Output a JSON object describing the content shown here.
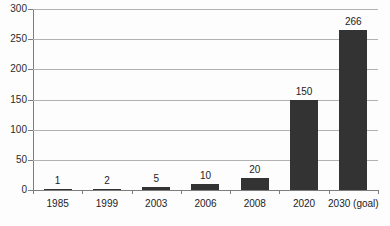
{
  "chart_data": {
    "type": "bar",
    "title": "",
    "xlabel": "",
    "ylabel": "",
    "categories": [
      "1985",
      "1999",
      "2003",
      "2006",
      "2008",
      "2020",
      "2030 (goal)"
    ],
    "values": [
      1,
      2,
      5,
      10,
      20,
      150,
      266
    ],
    "data_labels": [
      "1",
      "2",
      "5",
      "10",
      "20",
      "150",
      "266"
    ],
    "ylim": [
      0,
      300
    ],
    "yticks": [
      0,
      50,
      100,
      150,
      200,
      250,
      300
    ],
    "ytick_labels": [
      "0",
      "50",
      "100",
      "150",
      "200",
      "250",
      "300"
    ],
    "grid": true,
    "legend": false,
    "series": [
      {
        "name": "",
        "values": [
          1,
          2,
          5,
          10,
          20,
          150,
          266
        ]
      }
    ],
    "colors": {
      "bar": "#333333",
      "gridline": "#b2b2b2",
      "axis": "#7d7d7d",
      "text": "#1c1c1c",
      "background": "#fdfdfd"
    }
  }
}
